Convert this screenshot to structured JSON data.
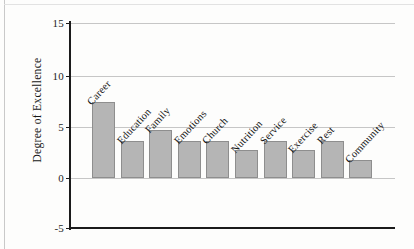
{
  "chart_data": {
    "type": "bar",
    "title": "",
    "xlabel": "",
    "ylabel": "Degree of Excellence",
    "ylim": [
      -5,
      15
    ],
    "yticks": [
      15,
      10,
      5,
      0,
      -5
    ],
    "grid": true,
    "legend": "none",
    "bar_color": "#b5b5b5",
    "bar_edge_color": "#8e8e8e",
    "categories": [
      "Career",
      "Education",
      "Family",
      "Emotions",
      "Church",
      "Nutrition",
      "Service",
      "Exercise",
      "Rest",
      "Community"
    ],
    "values": [
      7.4,
      3.6,
      4.7,
      3.6,
      3.6,
      2.7,
      3.6,
      2.7,
      3.6,
      1.8
    ]
  },
  "axis": {
    "y_tick_labels": [
      "15",
      "10",
      "5",
      "0",
      "-5"
    ],
    "y_axis_title": "Degree of Excellence"
  }
}
